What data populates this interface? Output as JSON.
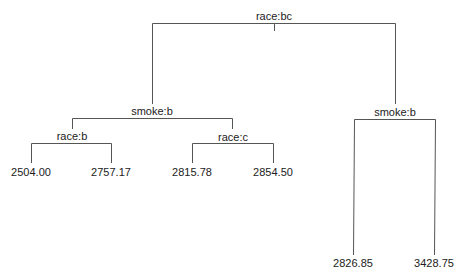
{
  "tree": {
    "line_color": "#555555",
    "text_color": "#222222",
    "root": {
      "label": "race:bc",
      "children": [
        {
          "label": "smoke:b",
          "children": [
            {
              "label": "race:b",
              "children": [
                {
                  "label": "2504.00"
                },
                {
                  "label": "2757.17"
                }
              ]
            },
            {
              "label": "race:c",
              "children": [
                {
                  "label": "2815.78"
                },
                {
                  "label": "2854.50"
                }
              ]
            }
          ]
        },
        {
          "label": "smoke:b",
          "children": [
            {
              "label": "2826.85"
            },
            {
              "label": "3428.75"
            }
          ]
        }
      ]
    }
  },
  "nodes": {
    "root": "race:bc",
    "left_smoke": "smoke:b",
    "right_smoke": "smoke:b",
    "race_b": "race:b",
    "race_c": "race:c",
    "leaf_1": "2504.00",
    "leaf_2": "2757.17",
    "leaf_3": "2815.78",
    "leaf_4": "2854.50",
    "leaf_5": "2826.85",
    "leaf_6": "3428.75"
  }
}
